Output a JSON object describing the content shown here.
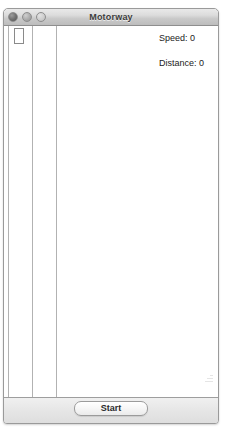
{
  "window": {
    "title": "Motorway",
    "controls": {
      "close_label": "close",
      "minimize_label": "minimize",
      "zoom_label": "zoom"
    }
  },
  "simulation": {
    "readouts": [
      {
        "id": "speed",
        "label": "Speed",
        "value": "0",
        "text": "Speed: 0"
      },
      {
        "id": "distance",
        "label": "Distance",
        "value": "0",
        "text": "Distance: 0"
      }
    ],
    "road": {
      "lane_line_x": [
        4,
        28,
        52
      ],
      "lane_line_color": "#b2b2b2",
      "lane_count": 2
    },
    "car": {
      "x": 10,
      "y": 2,
      "width": 10,
      "height": 16,
      "outline_color": "#8a8a8a",
      "fill_color": "#ffffff"
    }
  },
  "controls": {
    "start_label": "Start"
  },
  "icons": {
    "resize_grip": "resize-grip-icon"
  },
  "colors": {
    "window_border": "#9a9a9a",
    "titlebar_text": "#3b3b3b",
    "canvas_background": "#ffffff",
    "bottom_bar": "#e6e6e6"
  }
}
